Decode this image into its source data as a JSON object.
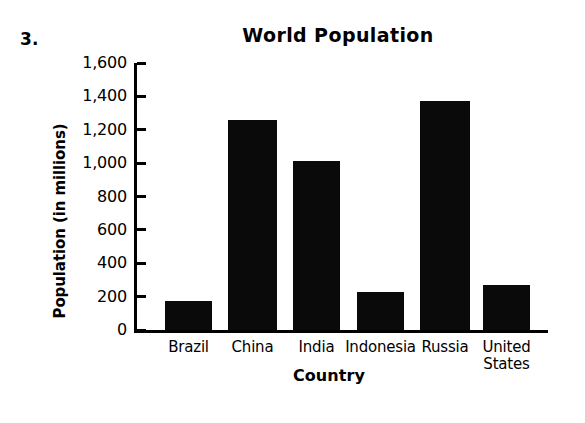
{
  "problem": {
    "number": "3."
  },
  "chart_data": {
    "type": "bar",
    "title": "World Population",
    "xlabel": "Country",
    "ylabel": "Population (in millions)",
    "categories": [
      "Brazil",
      "China",
      "India",
      "Indonesia",
      "Russia",
      "United States"
    ],
    "values": [
      175,
      1260,
      1010,
      225,
      1370,
      270
    ],
    "ylim": [
      0,
      1600
    ],
    "yticks": [
      0,
      200,
      400,
      600,
      800,
      1000,
      1200,
      1400,
      1600
    ],
    "ytick_labels": [
      "0",
      "200",
      "400",
      "600",
      "800",
      "1,000",
      "1,200",
      "1,400",
      "1,600"
    ],
    "grid": false,
    "legend": false,
    "bar_color": "#0a0a0a",
    "series": [
      {
        "name": "Population",
        "values": [
          175,
          1260,
          1010,
          225,
          1370,
          270
        ]
      }
    ]
  }
}
